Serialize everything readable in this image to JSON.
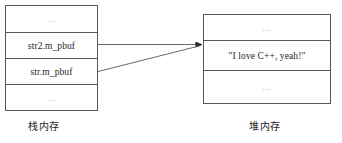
{
  "diagram": {
    "line_color": "#58585a",
    "text_color": "#1d1d1f",
    "background": "#ffffff",
    "stack": {
      "caption": "栈内存",
      "rows": [
        {
          "label": "…",
          "kind": "ellipsis"
        },
        {
          "label": "str2.m_pbuf",
          "kind": "pointer"
        },
        {
          "label": "str.m_pbuf",
          "kind": "pointer"
        },
        {
          "label": "…",
          "kind": "ellipsis"
        }
      ]
    },
    "heap": {
      "caption": "堆内存",
      "rows": [
        {
          "label": "…",
          "kind": "ellipsis"
        },
        {
          "label": "\"I love C++, yeah!\"",
          "kind": "value"
        },
        {
          "label": "…",
          "kind": "ellipsis"
        }
      ]
    },
    "arrows": [
      {
        "name": "str2-pointer-arrow",
        "from": "str2.m_pbuf",
        "to": "\"I love C++, yeah!\""
      },
      {
        "name": "str-pointer-arrow",
        "from": "str.m_pbuf",
        "to": "\"I love C++, yeah!\""
      }
    ]
  }
}
